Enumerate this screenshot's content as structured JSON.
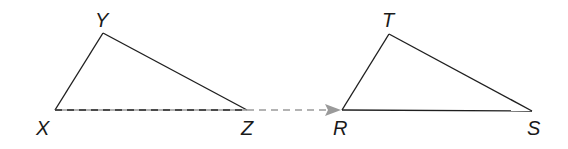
{
  "diagram": {
    "type": "triangle-translation",
    "colors": {
      "stroke": "#1f1f1f",
      "arrow": "#9a9a9a",
      "background": "#ffffff"
    },
    "triangles": [
      {
        "name": "XYZ",
        "vertices": [
          {
            "label": "X",
            "x": 55,
            "y": 110
          },
          {
            "label": "Y",
            "x": 103,
            "y": 33
          },
          {
            "label": "Z",
            "x": 247,
            "y": 110
          }
        ]
      },
      {
        "name": "RST",
        "vertices": [
          {
            "label": "R",
            "x": 342,
            "y": 110
          },
          {
            "label": "T",
            "x": 389,
            "y": 34
          },
          {
            "label": "S",
            "x": 532,
            "y": 111
          }
        ]
      }
    ],
    "translation_arrow": {
      "from": {
        "x": 55,
        "y": 110
      },
      "to": {
        "x": 340,
        "y": 110
      },
      "style": "dashed"
    },
    "labels": {
      "X": "X",
      "Y": "Y",
      "Z": "Z",
      "R": "R",
      "S": "S",
      "T": "T"
    }
  }
}
